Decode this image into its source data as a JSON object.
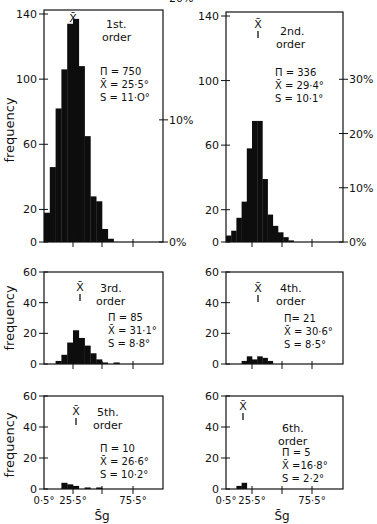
{
  "chart_data": [
    {
      "type": "bar",
      "title": "1st. order",
      "stats": {
        "n": "Π = 750",
        "mean": "X̄ = 25·5°",
        "sd": "S = 11·O°"
      },
      "ylabel": "frequency",
      "ylim": [
        0,
        140
      ],
      "yticks": [
        0,
        20,
        60,
        100,
        140
      ],
      "right_axis": {
        "ticks": [
          "0%",
          "10%",
          "20%"
        ],
        "values_pct": [
          0,
          10,
          20
        ]
      },
      "x_bin_start": 0.5,
      "bin_width": 5,
      "values_note": "Approximate values estimated visually from the figure; not exact source data.",
      "values": [
        18,
        46,
        82,
        106,
        134,
        137,
        108,
        65,
        28,
        25,
        8,
        2
      ]
    },
    {
      "type": "bar",
      "title": "2nd. order",
      "stats": {
        "n": "Π = 336",
        "mean": "X̄ = 29·4°",
        "sd": "S = 10·1°"
      },
      "ylabel": "",
      "ylim": [
        0,
        140
      ],
      "yticks": [
        0,
        20,
        60,
        100,
        140
      ],
      "right_axis": {
        "ticks": [
          "0%",
          "10%",
          "20%",
          "30%"
        ],
        "values_pct": [
          0,
          10,
          20,
          30
        ]
      },
      "x_bin_start": 0.5,
      "bin_width": 5,
      "values_note": "Approximate values estimated visually from the figure; not exact source data.",
      "values": [
        4,
        7,
        15,
        25,
        58,
        75,
        75,
        39,
        17,
        10,
        6,
        3,
        1
      ]
    },
    {
      "type": "bar",
      "title": "3rd. order",
      "stats": {
        "n": "Π = 85",
        "mean": "X̄ = 31·1°",
        "sd": "S = 8·8°"
      },
      "ylabel": "frequency",
      "ylim": [
        0,
        60
      ],
      "yticks": [
        0,
        20,
        40,
        60
      ],
      "x_bin_start": 10.5,
      "bin_width": 5,
      "values_note": "Approximate values estimated visually from the figure; not exact source data.",
      "values": [
        2,
        6,
        14,
        22,
        17,
        12,
        7,
        3,
        1,
        0,
        1
      ]
    },
    {
      "type": "bar",
      "title": "4th. order",
      "stats": {
        "n": "Π= 21",
        "mean": "X̄ = 30·6°",
        "sd": "S = 8·5°"
      },
      "ylabel": "",
      "ylim": [
        0,
        60
      ],
      "yticks": [
        0,
        20,
        40,
        60
      ],
      "x_bin_start": 15.5,
      "bin_width": 5,
      "values_note": "Approximate values estimated visually from the figure; not exact source data.",
      "values": [
        2,
        5,
        3,
        5,
        4,
        2
      ]
    },
    {
      "type": "bar",
      "title": "5th. order",
      "stats": {
        "n": "Π = 10",
        "mean": "X̄ = 26·6°",
        "sd": "S = 10·2°"
      },
      "ylabel": "frequency",
      "ylim": [
        0,
        60
      ],
      "yticks": [
        0,
        20,
        40,
        60
      ],
      "xticks": [
        "0·5°",
        "25·5°",
        "75·5°"
      ],
      "xlabel": "S̄g",
      "x_bin_start": 15.5,
      "bin_width": 5,
      "values_note": "Approximate values estimated visually from the figure; not exact source data.",
      "values": [
        4,
        3,
        2,
        0,
        1,
        0,
        1
      ]
    },
    {
      "type": "bar",
      "title": "6th. order",
      "stats": {
        "n": "Π = 5",
        "mean": "X̄ =16·8°",
        "sd": "S = 2·2°"
      },
      "ylabel": "",
      "ylim": [
        0,
        60
      ],
      "yticks": [
        0,
        20,
        40,
        60
      ],
      "xticks": [
        "0·5°",
        "25·5°",
        "75·5°"
      ],
      "xlabel": "S̄g",
      "x_bin_start": 10.5,
      "bin_width": 5,
      "values_note": "Approximate values estimated visually from the figure; not exact source data.",
      "values": [
        2,
        4
      ]
    }
  ]
}
